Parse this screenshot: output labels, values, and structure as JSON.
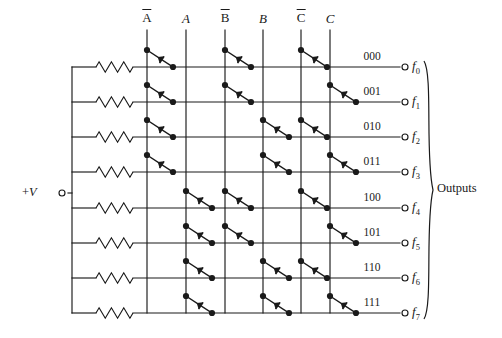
{
  "diagram": {
    "type": "3-to-8 diode decoder matrix",
    "supply": {
      "label": "+V",
      "terminal": "open-circle"
    },
    "outputs_group_label": "Outputs",
    "columns": [
      {
        "id": "not-a",
        "label": "A",
        "overbar": true,
        "x": 147
      },
      {
        "id": "a",
        "label": "A",
        "overbar": false,
        "x": 186
      },
      {
        "id": "not-b",
        "label": "B",
        "overbar": true,
        "x": 225
      },
      {
        "id": "b",
        "label": "B",
        "overbar": false,
        "x": 263
      },
      {
        "id": "not-c",
        "label": "C",
        "overbar": true,
        "x": 301
      },
      {
        "id": "c",
        "label": "C",
        "overbar": false,
        "x": 330
      }
    ],
    "rows": [
      {
        "code": "000",
        "output": "f",
        "subscript": "0",
        "y": 67,
        "diodes": [
          "not-a",
          "not-b",
          "not-c"
        ]
      },
      {
        "code": "001",
        "output": "f",
        "subscript": "1",
        "y": 102,
        "diodes": [
          "not-a",
          "not-b",
          "c"
        ]
      },
      {
        "code": "010",
        "output": "f",
        "subscript": "2",
        "y": 137,
        "diodes": [
          "not-a",
          "b",
          "not-c"
        ]
      },
      {
        "code": "011",
        "output": "f",
        "subscript": "3",
        "y": 172,
        "diodes": [
          "not-a",
          "b",
          "c"
        ]
      },
      {
        "code": "100",
        "output": "f",
        "subscript": "4",
        "y": 208,
        "diodes": [
          "a",
          "not-b",
          "not-c"
        ]
      },
      {
        "code": "101",
        "output": "f",
        "subscript": "5",
        "y": 243,
        "diodes": [
          "a",
          "not-b",
          "c"
        ]
      },
      {
        "code": "110",
        "output": "f",
        "subscript": "6",
        "y": 278,
        "diodes": [
          "a",
          "b",
          "not-c"
        ]
      },
      {
        "code": "111",
        "output": "f",
        "subscript": "7",
        "y": 313,
        "diodes": [
          "a",
          "b",
          "c"
        ]
      }
    ],
    "geometry": {
      "bus_x": 72,
      "resistor_x1": 96,
      "resistor_x2": 133,
      "column_top_y": 30,
      "row_end_x": 400,
      "terminal_x": 405,
      "supply_terminal_x": 62,
      "supply_y": 193,
      "supply_wire_x1": 68,
      "brace_x": 424,
      "code_label_dx": -28,
      "diode_dx": 26,
      "diode_dy": 17
    },
    "colors": {
      "wire": "#1a1a1a",
      "background": "#ffffff",
      "text": "#1a1a1a"
    }
  }
}
